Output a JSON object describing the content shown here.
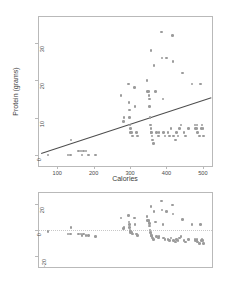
{
  "figure": {
    "background": "#ffffff",
    "point_color": "#9b9b9b",
    "line_color": "#4d4d4d",
    "frame_color": "#b9b9b9",
    "axis_text_color": "#4a4a4a"
  },
  "panels": {
    "scatter": {
      "name": "protein-vs-calories-scatter",
      "xlabel": "Calories",
      "ylabel": "Protein (grams)",
      "x_ticks": [
        "100",
        "200",
        "300",
        "400",
        "500"
      ],
      "y_ticks": [
        "0",
        "10",
        "20",
        "30"
      ]
    },
    "residual": {
      "name": "residual-plot",
      "xlabel": "",
      "ylabel": "",
      "x_ticks": [],
      "y_ticks": [
        "-20",
        "0",
        "20"
      ]
    }
  },
  "chart_data": [
    {
      "type": "scatter",
      "name": "protein-vs-calories",
      "title": "",
      "xlabel": "Calories",
      "ylabel": "Protein (grams)",
      "xlim": [
        50,
        525
      ],
      "ylim": [
        -3,
        37
      ],
      "x_ticks": [
        100,
        200,
        300,
        400,
        500
      ],
      "y_ticks": [
        0,
        10,
        20,
        30
      ],
      "grid": false,
      "legend": null,
      "marker": "open-circle",
      "marker_color": "#9b9b9b",
      "trendline": {
        "type": "linear-regression",
        "color": "#4d4d4d",
        "x_start": 56,
        "y_start": 0.4,
        "x_end": 522,
        "y_end": 15.3
      },
      "points": [
        {
          "x": 75,
          "y": 0
        },
        {
          "x": 130,
          "y": 0
        },
        {
          "x": 136,
          "y": 0
        },
        {
          "x": 138,
          "y": 4
        },
        {
          "x": 168,
          "y": 0
        },
        {
          "x": 186,
          "y": 0
        },
        {
          "x": 205,
          "y": 0
        },
        {
          "x": 158,
          "y": 1
        },
        {
          "x": 165,
          "y": 1
        },
        {
          "x": 172,
          "y": 1
        },
        {
          "x": 179,
          "y": 1
        },
        {
          "x": 275,
          "y": 16
        },
        {
          "x": 282,
          "y": 9
        },
        {
          "x": 283,
          "y": 10
        },
        {
          "x": 296,
          "y": 19
        },
        {
          "x": 297,
          "y": 14
        },
        {
          "x": 298,
          "y": 12
        },
        {
          "x": 299,
          "y": 10
        },
        {
          "x": 300,
          "y": 8
        },
        {
          "x": 301,
          "y": 7
        },
        {
          "x": 302,
          "y": 6
        },
        {
          "x": 304,
          "y": 6
        },
        {
          "x": 306,
          "y": 5
        },
        {
          "x": 312,
          "y": 18
        },
        {
          "x": 314,
          "y": 13
        },
        {
          "x": 318,
          "y": 6
        },
        {
          "x": 320,
          "y": 5
        },
        {
          "x": 347,
          "y": 20
        },
        {
          "x": 348,
          "y": 17
        },
        {
          "x": 350,
          "y": 17
        },
        {
          "x": 352,
          "y": 16
        },
        {
          "x": 353,
          "y": 15
        },
        {
          "x": 354,
          "y": 13
        },
        {
          "x": 355,
          "y": 10
        },
        {
          "x": 356,
          "y": 8
        },
        {
          "x": 357,
          "y": 7
        },
        {
          "x": 358,
          "y": 6
        },
        {
          "x": 359,
          "y": 6
        },
        {
          "x": 360,
          "y": 5
        },
        {
          "x": 362,
          "y": 4
        },
        {
          "x": 364,
          "y": 3
        },
        {
          "x": 358,
          "y": 28
        },
        {
          "x": 366,
          "y": 24
        },
        {
          "x": 370,
          "y": 17
        },
        {
          "x": 372,
          "y": 6
        },
        {
          "x": 378,
          "y": 5
        },
        {
          "x": 380,
          "y": 6
        },
        {
          "x": 386,
          "y": 33
        },
        {
          "x": 388,
          "y": 26
        },
        {
          "x": 390,
          "y": 15
        },
        {
          "x": 392,
          "y": 6
        },
        {
          "x": 396,
          "y": 5
        },
        {
          "x": 400,
          "y": 26
        },
        {
          "x": 404,
          "y": 6
        },
        {
          "x": 408,
          "y": 5
        },
        {
          "x": 412,
          "y": 7
        },
        {
          "x": 416,
          "y": 32
        },
        {
          "x": 418,
          "y": 25
        },
        {
          "x": 420,
          "y": 5
        },
        {
          "x": 424,
          "y": 4
        },
        {
          "x": 428,
          "y": 6
        },
        {
          "x": 432,
          "y": 5
        },
        {
          "x": 436,
          "y": 7
        },
        {
          "x": 440,
          "y": 8
        },
        {
          "x": 444,
          "y": 22
        },
        {
          "x": 448,
          "y": 6
        },
        {
          "x": 452,
          "y": 5
        },
        {
          "x": 460,
          "y": 7
        },
        {
          "x": 470,
          "y": 19
        },
        {
          "x": 478,
          "y": 8
        },
        {
          "x": 480,
          "y": 7
        },
        {
          "x": 482,
          "y": 7
        },
        {
          "x": 484,
          "y": 8
        },
        {
          "x": 486,
          "y": 6
        },
        {
          "x": 490,
          "y": 5
        },
        {
          "x": 494,
          "y": 19
        },
        {
          "x": 496,
          "y": 7
        },
        {
          "x": 498,
          "y": 8
        },
        {
          "x": 500,
          "y": 7
        },
        {
          "x": 502,
          "y": 5
        }
      ]
    },
    {
      "type": "scatter",
      "name": "residuals-vs-calories",
      "title": "",
      "xlabel": "",
      "ylabel": "",
      "xlim": [
        50,
        525
      ],
      "ylim": [
        -28,
        28
      ],
      "x_ticks": [],
      "y_ticks": [
        -20,
        0,
        20
      ],
      "grid": false,
      "legend": null,
      "marker": "open-circle",
      "marker_color": "#9b9b9b",
      "reference_line": {
        "y": 0,
        "color": "#c8c8c8",
        "style": "dotted"
      },
      "points": [
        {
          "x": 75,
          "y": -1
        },
        {
          "x": 130,
          "y": -3
        },
        {
          "x": 136,
          "y": -3
        },
        {
          "x": 138,
          "y": 2
        },
        {
          "x": 168,
          "y": -4
        },
        {
          "x": 186,
          "y": -4
        },
        {
          "x": 205,
          "y": -5
        },
        {
          "x": 158,
          "y": -3
        },
        {
          "x": 165,
          "y": -3
        },
        {
          "x": 172,
          "y": -3
        },
        {
          "x": 179,
          "y": -4
        },
        {
          "x": 275,
          "y": 9
        },
        {
          "x": 282,
          "y": 1
        },
        {
          "x": 283,
          "y": 2
        },
        {
          "x": 296,
          "y": 11
        },
        {
          "x": 297,
          "y": 6
        },
        {
          "x": 298,
          "y": 4
        },
        {
          "x": 299,
          "y": 2
        },
        {
          "x": 300,
          "y": 0
        },
        {
          "x": 301,
          "y": -1
        },
        {
          "x": 302,
          "y": -2
        },
        {
          "x": 304,
          "y": -2
        },
        {
          "x": 306,
          "y": -3
        },
        {
          "x": 312,
          "y": 9
        },
        {
          "x": 314,
          "y": 4
        },
        {
          "x": 318,
          "y": -3
        },
        {
          "x": 320,
          "y": -4
        },
        {
          "x": 347,
          "y": 10
        },
        {
          "x": 348,
          "y": 7
        },
        {
          "x": 350,
          "y": 7
        },
        {
          "x": 352,
          "y": 6
        },
        {
          "x": 353,
          "y": 5
        },
        {
          "x": 354,
          "y": 3
        },
        {
          "x": 355,
          "y": 0
        },
        {
          "x": 356,
          "y": -2
        },
        {
          "x": 357,
          "y": -3
        },
        {
          "x": 358,
          "y": -4
        },
        {
          "x": 359,
          "y": -4
        },
        {
          "x": 360,
          "y": -5
        },
        {
          "x": 362,
          "y": -6
        },
        {
          "x": 364,
          "y": -7
        },
        {
          "x": 358,
          "y": 18
        },
        {
          "x": 366,
          "y": 14
        },
        {
          "x": 370,
          "y": 6
        },
        {
          "x": 372,
          "y": -5
        },
        {
          "x": 378,
          "y": -6
        },
        {
          "x": 380,
          "y": -5
        },
        {
          "x": 386,
          "y": 22
        },
        {
          "x": 388,
          "y": 15
        },
        {
          "x": 390,
          "y": 4
        },
        {
          "x": 392,
          "y": -6
        },
        {
          "x": 396,
          "y": -7
        },
        {
          "x": 400,
          "y": 14
        },
        {
          "x": 404,
          "y": -7
        },
        {
          "x": 408,
          "y": -8
        },
        {
          "x": 412,
          "y": -6
        },
        {
          "x": 416,
          "y": 19
        },
        {
          "x": 418,
          "y": 12
        },
        {
          "x": 420,
          "y": -8
        },
        {
          "x": 424,
          "y": -9
        },
        {
          "x": 428,
          "y": -7
        },
        {
          "x": 432,
          "y": -8
        },
        {
          "x": 436,
          "y": -6
        },
        {
          "x": 440,
          "y": -5
        },
        {
          "x": 444,
          "y": 8
        },
        {
          "x": 448,
          "y": -8
        },
        {
          "x": 452,
          "y": -9
        },
        {
          "x": 460,
          "y": -7
        },
        {
          "x": 470,
          "y": 4
        },
        {
          "x": 478,
          "y": -7
        },
        {
          "x": 480,
          "y": -8
        },
        {
          "x": 482,
          "y": -8
        },
        {
          "x": 484,
          "y": -7
        },
        {
          "x": 486,
          "y": -9
        },
        {
          "x": 490,
          "y": -10
        },
        {
          "x": 494,
          "y": 4
        },
        {
          "x": 496,
          "y": -8
        },
        {
          "x": 498,
          "y": -7
        },
        {
          "x": 500,
          "y": -8
        },
        {
          "x": 502,
          "y": -10
        }
      ]
    }
  ]
}
